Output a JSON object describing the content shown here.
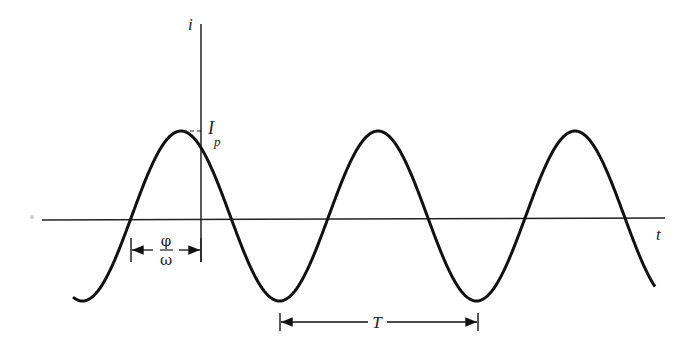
{
  "diagram": {
    "title": "",
    "axes": {
      "vertical_label": "i",
      "horizontal_label": "t"
    },
    "peak_label": {
      "main": "I",
      "sub": "p"
    },
    "phase_label": {
      "numerator": "φ",
      "denominator": "ω"
    },
    "period_label": "T",
    "colors": {
      "stroke": "#111111",
      "text": "#222222",
      "background": "#ffffff"
    }
  },
  "geometry": {
    "origin_x": 201,
    "axis_y": 220,
    "midline_y": 216,
    "amplitude_px": 85,
    "period_px": 197,
    "first_peak_x": 181,
    "curve_start_x": 73,
    "curve_end_x": 655
  }
}
